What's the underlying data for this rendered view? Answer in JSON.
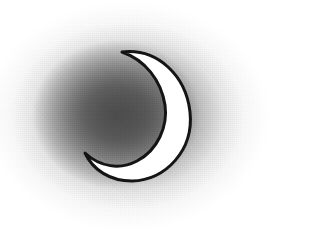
{
  "artwork": {
    "title": "Crescent Moon",
    "subject": "crescent-moon",
    "medium": "hand-drawn ink line art with pencil shading",
    "caption": "",
    "canvas": {
      "width": 321,
      "height": 242,
      "background_color": "#ffffff"
    },
    "palette": {
      "background": "#ffffff",
      "halo_darkest": "#4a4a4a",
      "halo_mid": "#808080",
      "halo_light": "#c4c4c4",
      "moon_fill": "#ffffff",
      "moon_outline": "#141414"
    },
    "halo": {
      "name": "radial-gray-wash",
      "center_x": 128,
      "center_y": 116,
      "radius_x": 150,
      "radius_y": 120,
      "core_center_x": 116,
      "core_center_y": 114,
      "texture": "grainy"
    },
    "moon": {
      "name": "crescent",
      "fill": "#ffffff",
      "outline_color": "#141414",
      "outline_width": 3,
      "upper_tip_x": 122,
      "upper_tip_y": 52,
      "lower_tip_x": 85,
      "lower_tip_y": 153,
      "outer_edge_x": 190,
      "top_y": 50,
      "bottom_y": 181,
      "opening_direction": "left",
      "path": "M 122 52 C 158 48 186 76 190 112 C 194 150 166 180 132 181 C 110 181 93 170 85 153 C 100 167 120 170 137 161 C 158 150 168 126 165 105 C 161 80 145 60 122 52 Z"
    }
  }
}
